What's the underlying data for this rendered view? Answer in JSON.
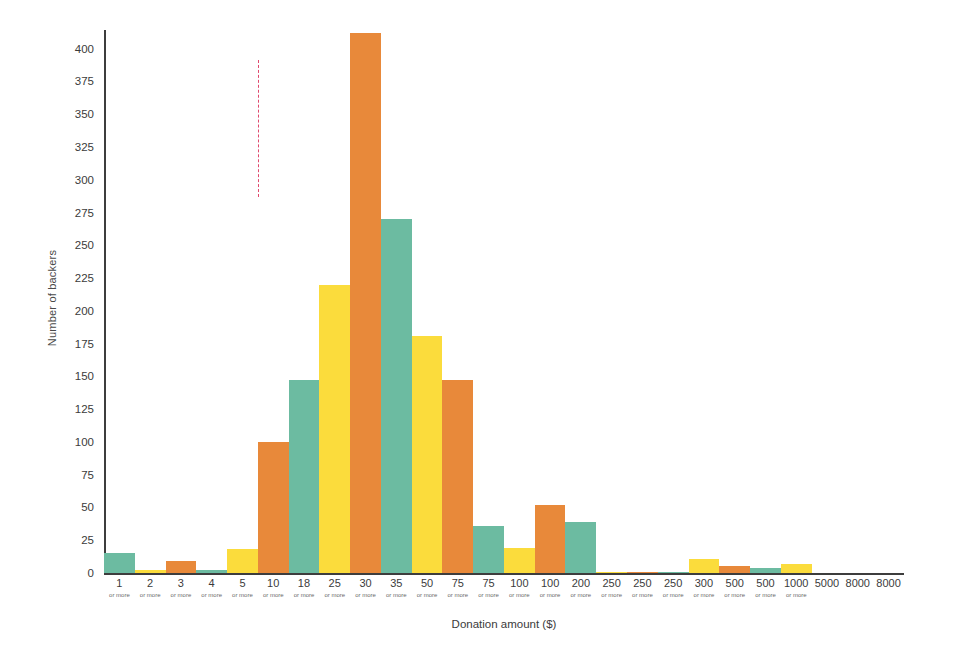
{
  "chart_data": {
    "type": "bar",
    "title": "",
    "xlabel": "Donation amount ($)",
    "ylabel": "Number of backers",
    "ylim": [
      0,
      412
    ],
    "yticks": [
      0,
      25,
      50,
      75,
      100,
      125,
      150,
      175,
      200,
      225,
      250,
      275,
      300,
      325,
      350,
      375,
      400
    ],
    "grid": false,
    "legend": null,
    "categories": [
      "1",
      "2",
      "3",
      "4",
      "5",
      "10",
      "18",
      "25",
      "30",
      "35",
      "50",
      "75",
      "75",
      "100",
      "100",
      "200",
      "250",
      "250",
      "250",
      "300",
      "500",
      "500",
      "1000",
      "5000",
      "8000",
      "8000"
    ],
    "category_sublabels": [
      "or more",
      "or more",
      "or more",
      "or more",
      "or more",
      "or more",
      "or more",
      "or more",
      "or more",
      "or more",
      "or more",
      "or more",
      "or more",
      "or more",
      "or more",
      "or more",
      "or more",
      "or more",
      "or more",
      "or more",
      "or more",
      "or more",
      "or more",
      "",
      "",
      ""
    ],
    "values": [
      15,
      2,
      9,
      2,
      18,
      100,
      147,
      220,
      412,
      270,
      181,
      147,
      36,
      19,
      52,
      39,
      1,
      1,
      1,
      11,
      5,
      4,
      7,
      0,
      0,
      0
    ],
    "bar_colors": [
      "teal",
      "yellow",
      "orange",
      "teal",
      "yellow",
      "orange",
      "teal",
      "yellow",
      "orange",
      "teal",
      "yellow",
      "orange",
      "teal",
      "yellow",
      "orange",
      "teal",
      "yellow",
      "orange",
      "teal",
      "yellow",
      "orange",
      "teal",
      "yellow",
      "orange",
      "teal",
      "yellow"
    ],
    "palette": {
      "teal": "#6cbba1",
      "yellow": "#fbdc3c",
      "orange": "#e8893a",
      "axis": "#3d3d3d",
      "marker": "#e04a6e",
      "background": "#ffffff"
    },
    "annotations": [
      {
        "type": "vertical-dashed-line",
        "at_category_index": 5,
        "at_category": "10 or more",
        "color": "#e04a6e",
        "top_value": 100
      }
    ]
  }
}
